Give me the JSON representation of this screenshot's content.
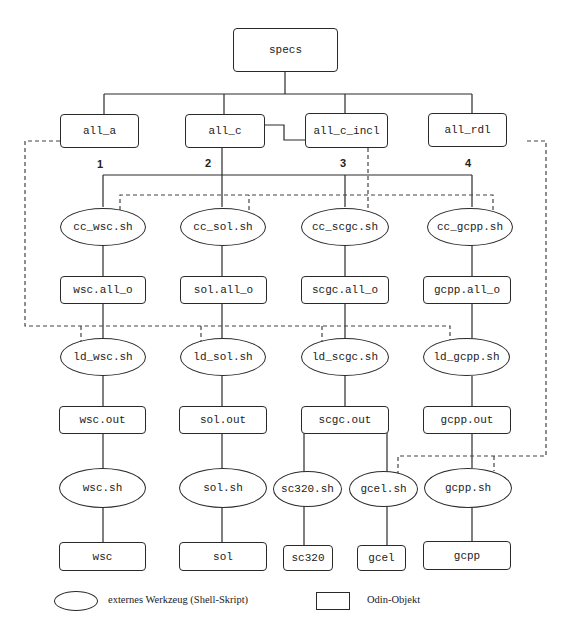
{
  "diagram": {
    "root": {
      "label": "specs"
    },
    "level1": [
      {
        "label": "all_a"
      },
      {
        "label": "all_c"
      },
      {
        "label": "all_c_incl"
      },
      {
        "label": "all_rdl"
      }
    ],
    "branch_numbers": [
      "1",
      "2",
      "3",
      "4"
    ],
    "compile_tools": [
      {
        "label": "cc_wsc.sh"
      },
      {
        "label": "cc_sol.sh"
      },
      {
        "label": "cc_scgc.sh"
      },
      {
        "label": "cc_gcpp.sh"
      }
    ],
    "objects": [
      {
        "label": "wsc.all_o"
      },
      {
        "label": "sol.all_o"
      },
      {
        "label": "scgc.all_o"
      },
      {
        "label": "gcpp.all_o"
      }
    ],
    "link_tools": [
      {
        "label": "ld_wsc.sh"
      },
      {
        "label": "ld_sol.sh"
      },
      {
        "label": "ld_scgc.sh"
      },
      {
        "label": "ld_gcpp.sh"
      }
    ],
    "outputs": [
      {
        "label": "wsc.out"
      },
      {
        "label": "sol.out"
      },
      {
        "label": "scgc.out"
      },
      {
        "label": "gcpp.out"
      }
    ],
    "run_tools": [
      {
        "label": "wsc.sh"
      },
      {
        "label": "sol.sh"
      },
      {
        "label": "sc320.sh"
      },
      {
        "label": "gcel.sh"
      },
      {
        "label": "gcpp.sh"
      }
    ],
    "results": [
      {
        "label": "wsc"
      },
      {
        "label": "sol"
      },
      {
        "label": "sc320"
      },
      {
        "label": "gcel"
      },
      {
        "label": "gcpp"
      }
    ]
  },
  "legend": {
    "ellipse_label": "externes Werkzeug (Shell-Skript)",
    "box_label": "Odin-Objekt"
  }
}
